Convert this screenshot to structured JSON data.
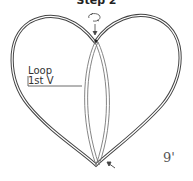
{
  "title": "Step 2",
  "label": {
    "line1": "Loop",
    "line2": "1st V"
  },
  "page_number": "9'",
  "colors": {
    "stroke": "#444444",
    "background": "#ffffff"
  }
}
